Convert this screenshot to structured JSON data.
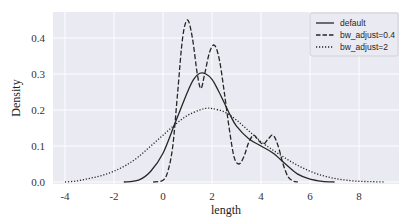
{
  "chart_data": {
    "type": "line",
    "title": "",
    "xlabel": "length",
    "ylabel": "Density",
    "xlim": [
      -4.4,
      9.6
    ],
    "ylim": [
      0.0,
      0.47
    ],
    "xticks": [
      -4,
      -2,
      0,
      2,
      4,
      6,
      8
    ],
    "yticks": [
      0.0,
      0.1,
      0.2,
      0.3,
      0.4
    ],
    "xtick_labels": [
      "-4",
      "-2",
      "0",
      "2",
      "4",
      "6",
      "8"
    ],
    "ytick_labels": [
      "0.0",
      "0.1",
      "0.2",
      "0.3",
      "0.4"
    ],
    "grid": true,
    "legend_position": "upper right",
    "background": "#eaeaf2",
    "series": [
      {
        "name": "default",
        "style": "solid",
        "color": "#262626",
        "x": [
          -1.6,
          -1.0,
          -0.5,
          0.0,
          0.5,
          1.0,
          1.25,
          1.5,
          1.75,
          2.0,
          2.25,
          2.5,
          2.75,
          3.0,
          3.5,
          4.0,
          4.5,
          5.0,
          5.5,
          6.0,
          6.5,
          7.0
        ],
        "values": [
          0.0,
          0.005,
          0.03,
          0.08,
          0.165,
          0.25,
          0.285,
          0.302,
          0.3,
          0.285,
          0.255,
          0.22,
          0.185,
          0.155,
          0.12,
          0.1,
          0.08,
          0.05,
          0.022,
          0.008,
          0.002,
          0.0
        ]
      },
      {
        "name": "bw_adjust=0.4",
        "style": "dashed",
        "color": "#262626",
        "x": [
          -0.4,
          0.0,
          0.2,
          0.4,
          0.6,
          0.8,
          1.0,
          1.2,
          1.4,
          1.55,
          1.7,
          1.9,
          2.1,
          2.3,
          2.5,
          2.7,
          2.9,
          3.1,
          3.3,
          3.5,
          3.7,
          3.9,
          4.1,
          4.3,
          4.5,
          4.7,
          4.9,
          5.1,
          5.3,
          5.5
        ],
        "values": [
          0.0,
          0.005,
          0.03,
          0.1,
          0.25,
          0.4,
          0.45,
          0.4,
          0.3,
          0.26,
          0.3,
          0.36,
          0.38,
          0.34,
          0.25,
          0.15,
          0.07,
          0.05,
          0.07,
          0.11,
          0.13,
          0.115,
          0.105,
          0.12,
          0.13,
          0.1,
          0.05,
          0.015,
          0.003,
          0.0
        ]
      },
      {
        "name": "bw_adjust=2",
        "style": "dotted",
        "color": "#262626",
        "x": [
          -4.0,
          -3.5,
          -3.0,
          -2.5,
          -2.0,
          -1.5,
          -1.0,
          -0.5,
          0.0,
          0.5,
          1.0,
          1.5,
          1.8,
          2.0,
          2.5,
          3.0,
          3.5,
          4.0,
          4.5,
          5.0,
          5.5,
          6.0,
          6.5,
          7.0,
          7.5,
          8.0,
          8.5,
          9.0
        ],
        "values": [
          0.0,
          0.003,
          0.01,
          0.018,
          0.03,
          0.047,
          0.07,
          0.1,
          0.13,
          0.16,
          0.185,
          0.2,
          0.205,
          0.204,
          0.195,
          0.172,
          0.142,
          0.112,
          0.088,
          0.066,
          0.046,
          0.03,
          0.018,
          0.01,
          0.005,
          0.002,
          0.001,
          0.0
        ]
      }
    ]
  },
  "legend": {
    "items": [
      "default",
      "bw_adjust=0.4",
      "bw_adjust=2"
    ]
  },
  "axes": {
    "xlabel": "length",
    "ylabel": "Density"
  }
}
